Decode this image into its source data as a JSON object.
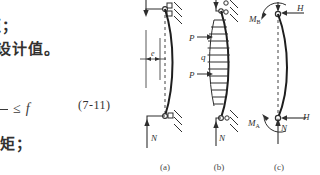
{
  "page": {
    "background_color": "#ffffff",
    "ink_color": "#33312f"
  },
  "text_lines": {
    "line_1": "矩；",
    "line_2": "力设计值。",
    "line_4": "抗矩；"
  },
  "formula": {
    "numerator": "",
    "denominator": "y",
    "relation": "≤",
    "right_symbol": "f",
    "equation_number": "(7-11)"
  },
  "figures": {
    "figure_a": {
      "caption": "(a)",
      "labels": {
        "eccentricity": "e",
        "axial_load": "N"
      }
    },
    "figure_b": {
      "caption": "(b)",
      "labels": {
        "point_load_top": "P",
        "distributed_load": "q",
        "point_load_bottom": "P",
        "axial_load": "N"
      }
    },
    "figure_c": {
      "caption": "(c)",
      "labels": {
        "moment_top": "M",
        "moment_top_sub": "B",
        "horizontal_top": "H",
        "moment_bottom": "M",
        "moment_bottom_sub": "A",
        "horizontal_bottom": "H",
        "axial_load": "N"
      }
    }
  }
}
